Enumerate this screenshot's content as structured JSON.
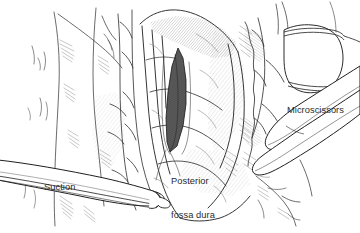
{
  "figure": {
    "kind": "surgical-line-drawing",
    "background_color": "#ffffff",
    "ink_color": "#262626",
    "shade_color": "#6e6e6e",
    "slit_color": "#565656"
  },
  "annotations": {
    "posterior_fossa_dura": {
      "line1": "Posterior",
      "line2": "fossa dura"
    },
    "microscissors": {
      "text": "Microscissors"
    },
    "suction": {
      "text": "Suction"
    }
  },
  "instruments": [
    {
      "name": "suction",
      "label": "Suction",
      "description": "tapered tubular suction cannula entering from lower left"
    },
    {
      "name": "microscissors",
      "label": "Microscissors",
      "description": "two elongated blades entering from upper right"
    },
    {
      "name": "forceps-tip",
      "label": "",
      "description": "rounded instrument tip at upper right"
    }
  ],
  "anatomy": [
    {
      "name": "posterior-fossa-dura",
      "label": "Posterior fossa dura",
      "description": "layered dural surface with vertical folds"
    },
    {
      "name": "dural-incision",
      "label": "",
      "description": "dark vertical slit opened in the dura at center"
    }
  ]
}
